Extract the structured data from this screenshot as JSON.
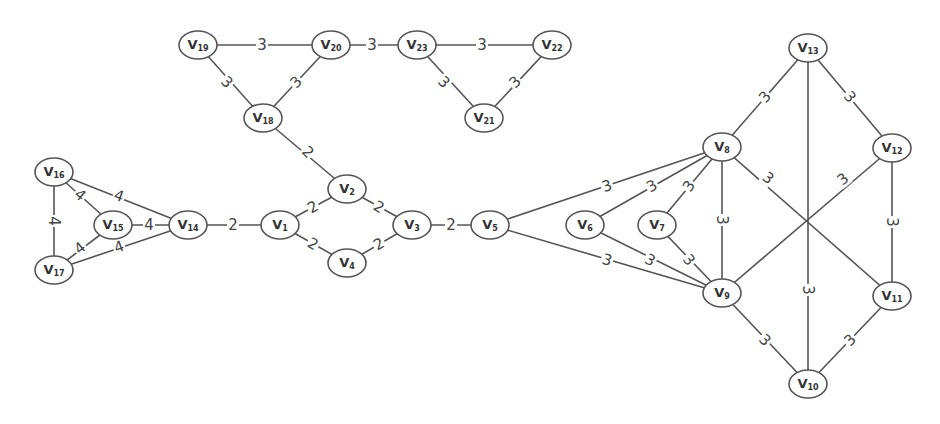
{
  "diagram": {
    "type": "weighted-undirected-graph",
    "nodes": [
      {
        "id": "v1",
        "label": "V",
        "sub": "1",
        "x": 280,
        "y": 225
      },
      {
        "id": "v2",
        "label": "V",
        "sub": "2",
        "x": 347,
        "y": 189
      },
      {
        "id": "v3",
        "label": "V",
        "sub": "3",
        "x": 412,
        "y": 225
      },
      {
        "id": "v4",
        "label": "V",
        "sub": "4",
        "x": 347,
        "y": 263
      },
      {
        "id": "v5",
        "label": "V",
        "sub": "5",
        "x": 490,
        "y": 225
      },
      {
        "id": "v6",
        "label": "V",
        "sub": "6",
        "x": 585,
        "y": 225
      },
      {
        "id": "v7",
        "label": "V",
        "sub": "7",
        "x": 657,
        "y": 225
      },
      {
        "id": "v8",
        "label": "V",
        "sub": "8",
        "x": 722,
        "y": 147
      },
      {
        "id": "v9",
        "label": "V",
        "sub": "9",
        "x": 722,
        "y": 293
      },
      {
        "id": "v10",
        "label": "V",
        "sub": "10",
        "x": 808,
        "y": 384
      },
      {
        "id": "v11",
        "label": "V",
        "sub": "11",
        "x": 892,
        "y": 296
      },
      {
        "id": "v12",
        "label": "V",
        "sub": "12",
        "x": 892,
        "y": 148
      },
      {
        "id": "v13",
        "label": "V",
        "sub": "13",
        "x": 808,
        "y": 48
      },
      {
        "id": "v14",
        "label": "V",
        "sub": "14",
        "x": 188,
        "y": 225
      },
      {
        "id": "v15",
        "label": "V",
        "sub": "15",
        "x": 113,
        "y": 225
      },
      {
        "id": "v16",
        "label": "V",
        "sub": "16",
        "x": 54,
        "y": 172
      },
      {
        "id": "v17",
        "label": "V",
        "sub": "17",
        "x": 54,
        "y": 270
      },
      {
        "id": "v18",
        "label": "V",
        "sub": "18",
        "x": 263,
        "y": 118
      },
      {
        "id": "v19",
        "label": "V",
        "sub": "19",
        "x": 198,
        "y": 45
      },
      {
        "id": "v20",
        "label": "V",
        "sub": "20",
        "x": 331,
        "y": 45
      },
      {
        "id": "v21",
        "label": "V",
        "sub": "21",
        "x": 484,
        "y": 118
      },
      {
        "id": "v22",
        "label": "V",
        "sub": "22",
        "x": 552,
        "y": 45
      },
      {
        "id": "v23",
        "label": "V",
        "sub": "23",
        "x": 417,
        "y": 45
      }
    ],
    "edges": [
      {
        "from": "v19",
        "to": "v20",
        "weight": "3",
        "lx": 262,
        "ly": 45,
        "rot": 0
      },
      {
        "from": "v20",
        "to": "v23",
        "weight": "3",
        "lx": 372,
        "ly": 45,
        "rot": 0
      },
      {
        "from": "v23",
        "to": "v22",
        "weight": "3",
        "lx": 482,
        "ly": 45,
        "rot": 0
      },
      {
        "from": "v19",
        "to": "v18",
        "weight": "3",
        "lx": 227,
        "ly": 82,
        "rot": 45
      },
      {
        "from": "v20",
        "to": "v18",
        "weight": "3",
        "lx": 296,
        "ly": 82,
        "rot": -45
      },
      {
        "from": "v23",
        "to": "v21",
        "weight": "3",
        "lx": 444,
        "ly": 82,
        "rot": 45
      },
      {
        "from": "v22",
        "to": "v21",
        "weight": "3",
        "lx": 515,
        "ly": 82,
        "rot": -45
      },
      {
        "from": "v18",
        "to": "v2",
        "weight": "2",
        "lx": 308,
        "ly": 152,
        "rot": 45
      },
      {
        "from": "v16",
        "to": "v14",
        "weight": "4",
        "lx": 119,
        "ly": 196,
        "rot": 20
      },
      {
        "from": "v16",
        "to": "v15",
        "weight": "4",
        "lx": 80,
        "ly": 195,
        "rot": 40
      },
      {
        "from": "v16",
        "to": "v17",
        "weight": "4",
        "lx": 54,
        "ly": 221,
        "rot": 90
      },
      {
        "from": "v15",
        "to": "v14",
        "weight": "4",
        "lx": 149,
        "ly": 225,
        "rot": 0
      },
      {
        "from": "v17",
        "to": "v15",
        "weight": "4",
        "lx": 80,
        "ly": 248,
        "rot": -40
      },
      {
        "from": "v17",
        "to": "v14",
        "weight": "4",
        "lx": 119,
        "ly": 247,
        "rot": -20
      },
      {
        "from": "v14",
        "to": "v1",
        "weight": "2",
        "lx": 233,
        "ly": 225,
        "rot": 0
      },
      {
        "from": "v1",
        "to": "v2",
        "weight": "2",
        "lx": 313,
        "ly": 207,
        "rot": -30
      },
      {
        "from": "v1",
        "to": "v4",
        "weight": "2",
        "lx": 313,
        "ly": 244,
        "rot": 30
      },
      {
        "from": "v2",
        "to": "v3",
        "weight": "2",
        "lx": 379,
        "ly": 207,
        "rot": 30
      },
      {
        "from": "v4",
        "to": "v3",
        "weight": "2",
        "lx": 379,
        "ly": 244,
        "rot": -30
      },
      {
        "from": "v3",
        "to": "v5",
        "weight": "2",
        "lx": 451,
        "ly": 225,
        "rot": 0
      },
      {
        "from": "v5",
        "to": "v8",
        "weight": "3",
        "lx": 607,
        "ly": 186,
        "rot": -18
      },
      {
        "from": "v6",
        "to": "v8",
        "weight": "3",
        "lx": 652,
        "ly": 186,
        "rot": -30
      },
      {
        "from": "v7",
        "to": "v8",
        "weight": "3",
        "lx": 689,
        "ly": 186,
        "rot": -55
      },
      {
        "from": "v5",
        "to": "v9",
        "weight": "3",
        "lx": 607,
        "ly": 260,
        "rot": 18
      },
      {
        "from": "v6",
        "to": "v9",
        "weight": "3",
        "lx": 650,
        "ly": 260,
        "rot": 28
      },
      {
        "from": "v7",
        "to": "v9",
        "weight": "3",
        "lx": 689,
        "ly": 260,
        "rot": 50
      },
      {
        "from": "v8",
        "to": "v9",
        "weight": "3",
        "lx": 722,
        "ly": 220,
        "rot": 90
      },
      {
        "from": "v8",
        "to": "v13",
        "weight": "3",
        "lx": 765,
        "ly": 97,
        "rot": -50
      },
      {
        "from": "v13",
        "to": "v12",
        "weight": "3",
        "lx": 850,
        "ly": 97,
        "rot": 50
      },
      {
        "from": "v8",
        "to": "v11",
        "weight": "3",
        "lx": 768,
        "ly": 178,
        "rot": 40
      },
      {
        "from": "v12",
        "to": "v9",
        "weight": "3",
        "lx": 843,
        "ly": 179,
        "rot": -40
      },
      {
        "from": "v13",
        "to": "v10",
        "weight": "3",
        "lx": 808,
        "ly": 290,
        "rot": 90
      },
      {
        "from": "v12",
        "to": "v11",
        "weight": "3",
        "lx": 892,
        "ly": 222,
        "rot": 90
      },
      {
        "from": "v9",
        "to": "v10",
        "weight": "3",
        "lx": 765,
        "ly": 340,
        "rot": 45
      },
      {
        "from": "v11",
        "to": "v10",
        "weight": "3",
        "lx": 850,
        "ly": 340,
        "rot": -45
      }
    ]
  }
}
